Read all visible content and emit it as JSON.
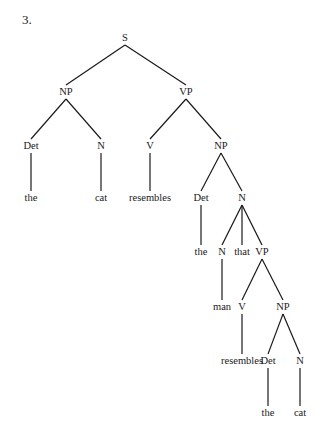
{
  "item_number": "3.",
  "tree": {
    "nodes": [
      {
        "id": "s",
        "label": "S",
        "x": 125,
        "y": 38
      },
      {
        "id": "np1",
        "label": "NP",
        "x": 66,
        "y": 92
      },
      {
        "id": "vp1",
        "label": "VP",
        "x": 186,
        "y": 92
      },
      {
        "id": "det1",
        "label": "Det",
        "x": 31,
        "y": 146
      },
      {
        "id": "n1",
        "label": "N",
        "x": 101,
        "y": 146
      },
      {
        "id": "v1",
        "label": "V",
        "x": 150,
        "y": 146
      },
      {
        "id": "np2",
        "label": "NP",
        "x": 221,
        "y": 146
      },
      {
        "id": "the1",
        "label": "the",
        "x": 31,
        "y": 198
      },
      {
        "id": "cat1",
        "label": "cat",
        "x": 101,
        "y": 198
      },
      {
        "id": "resembles1",
        "label": "resembles",
        "x": 150,
        "y": 198
      },
      {
        "id": "det2",
        "label": "Det",
        "x": 201,
        "y": 198
      },
      {
        "id": "n2",
        "label": "N",
        "x": 242,
        "y": 198
      },
      {
        "id": "the2",
        "label": "the",
        "x": 201,
        "y": 252
      },
      {
        "id": "n3",
        "label": "N",
        "x": 222,
        "y": 252
      },
      {
        "id": "that",
        "label": "that",
        "x": 242,
        "y": 252
      },
      {
        "id": "vp2",
        "label": "VP",
        "x": 262,
        "y": 252
      },
      {
        "id": "man",
        "label": "man",
        "x": 222,
        "y": 307
      },
      {
        "id": "v2",
        "label": "V",
        "x": 242,
        "y": 307
      },
      {
        "id": "np3",
        "label": "NP",
        "x": 283,
        "y": 307
      },
      {
        "id": "resembles2",
        "label": "resembles",
        "x": 242,
        "y": 361
      },
      {
        "id": "det3",
        "label": "Det",
        "x": 268,
        "y": 361
      },
      {
        "id": "n4",
        "label": "N",
        "x": 300,
        "y": 361
      },
      {
        "id": "the3",
        "label": "the",
        "x": 268,
        "y": 413
      },
      {
        "id": "cat2",
        "label": "cat",
        "x": 300,
        "y": 413
      }
    ],
    "edges": [
      [
        "s",
        "np1"
      ],
      [
        "s",
        "vp1"
      ],
      [
        "np1",
        "det1"
      ],
      [
        "np1",
        "n1"
      ],
      [
        "vp1",
        "v1"
      ],
      [
        "vp1",
        "np2"
      ],
      [
        "det1",
        "the1"
      ],
      [
        "n1",
        "cat1"
      ],
      [
        "v1",
        "resembles1"
      ],
      [
        "np2",
        "det2"
      ],
      [
        "np2",
        "n2"
      ],
      [
        "det2",
        "the2"
      ],
      [
        "n2",
        "n3"
      ],
      [
        "n2",
        "that"
      ],
      [
        "n2",
        "vp2"
      ],
      [
        "n3",
        "man"
      ],
      [
        "vp2",
        "v2"
      ],
      [
        "vp2",
        "np3"
      ],
      [
        "v2",
        "resembles2"
      ],
      [
        "np3",
        "det3"
      ],
      [
        "np3",
        "n4"
      ],
      [
        "det3",
        "the3"
      ],
      [
        "n4",
        "cat2"
      ]
    ]
  }
}
